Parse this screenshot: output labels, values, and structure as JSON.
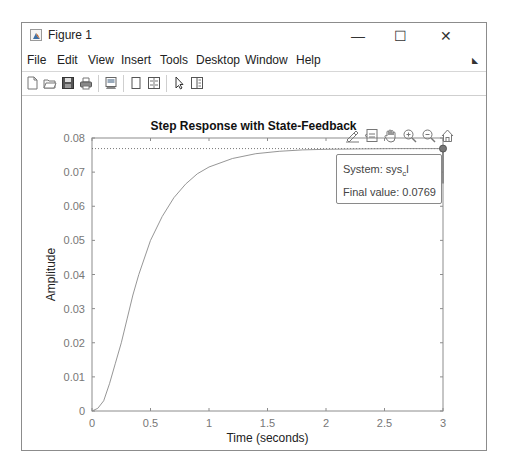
{
  "window": {
    "title": "Figure 1",
    "controls": {
      "minimize": "—",
      "maximize": "☐",
      "close": "✕"
    }
  },
  "menubar": {
    "items": [
      {
        "label": "File"
      },
      {
        "label": "Edit"
      },
      {
        "label": "View"
      },
      {
        "label": "Insert"
      },
      {
        "label": "Tools"
      },
      {
        "label": "Desktop"
      },
      {
        "label": "Window"
      },
      {
        "label": "Help"
      }
    ],
    "dock_icon": "dock-arrow-icon"
  },
  "toolbar": {
    "buttons": [
      {
        "name": "new-figure-icon"
      },
      {
        "name": "open-file-icon"
      },
      {
        "name": "save-icon"
      },
      {
        "name": "print-icon"
      },
      {
        "name": "link-plot-icon"
      },
      {
        "name": "hide-plot-tools-icon"
      },
      {
        "name": "show-plot-tools-icon"
      },
      {
        "name": "edit-plot-pointer-icon"
      },
      {
        "name": "property-inspector-icon"
      }
    ]
  },
  "axes_toolbar": {
    "buttons": [
      {
        "name": "brush-icon"
      },
      {
        "name": "data-tips-icon"
      },
      {
        "name": "pan-hand-icon"
      },
      {
        "name": "zoom-in-icon"
      },
      {
        "name": "zoom-out-icon"
      },
      {
        "name": "home-restore-view-icon"
      }
    ]
  },
  "datatip": {
    "system_label": "System: sys",
    "system_subscript": "c",
    "system_suffix": "l",
    "final_value_label": "Final value: 0.0769"
  },
  "chart_data": {
    "type": "line",
    "title": "Step Response with State-Feedback",
    "xlabel": "Time (seconds)",
    "ylabel": "Amplitude",
    "xlim": [
      0,
      3
    ],
    "ylim": [
      0,
      0.08
    ],
    "xticks": [
      "0",
      "0.5",
      "1",
      "1.5",
      "2",
      "2.5",
      "3"
    ],
    "yticks": [
      "0",
      "0.01",
      "0.02",
      "0.03",
      "0.04",
      "0.05",
      "0.06",
      "0.07",
      "0.08"
    ],
    "grid": false,
    "series": [
      {
        "name": "sys_cl",
        "x": [
          0,
          0.05,
          0.1,
          0.15,
          0.2,
          0.25,
          0.3,
          0.35,
          0.4,
          0.5,
          0.6,
          0.7,
          0.8,
          0.9,
          1.0,
          1.2,
          1.4,
          1.6,
          1.8,
          2.0,
          2.3,
          2.6,
          3.0
        ],
        "y": [
          0,
          0.0008,
          0.003,
          0.008,
          0.014,
          0.02,
          0.027,
          0.034,
          0.04,
          0.05,
          0.057,
          0.0625,
          0.0665,
          0.0695,
          0.0715,
          0.074,
          0.0754,
          0.0761,
          0.0765,
          0.0767,
          0.0768,
          0.0769,
          0.0769
        ]
      }
    ],
    "reference_line": {
      "style": "dotted",
      "y": 0.0769
    },
    "annotations": [
      {
        "type": "datatip",
        "x": 3,
        "y": 0.0769,
        "text": [
          "System: sys_cl",
          "Final value: 0.0769"
        ]
      }
    ]
  }
}
